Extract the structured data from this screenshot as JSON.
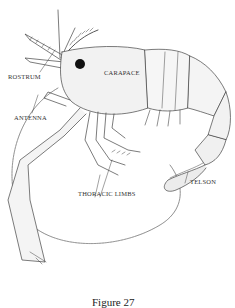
{
  "figure": {
    "caption": "Figure 27",
    "labels": {
      "rostrum": "ROSTRUM",
      "carapace": "CARAPACE",
      "antenna": "ANTENNA",
      "thoracic_limbs": "THORACIC LIMBS",
      "telson": "TELSON"
    },
    "colors": {
      "ink": "#333333",
      "shade": "#9a9a9a",
      "background": "#ffffff"
    }
  }
}
